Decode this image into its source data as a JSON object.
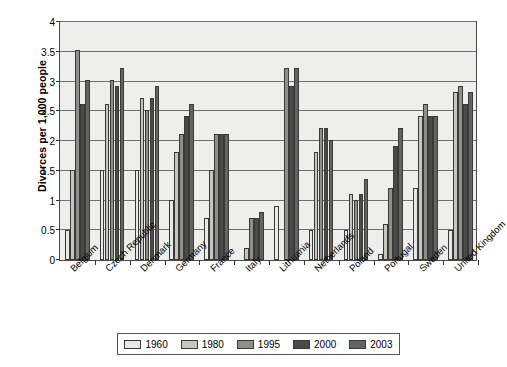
{
  "chart_data": {
    "type": "bar",
    "title": "",
    "xlabel": "",
    "ylabel": "Divorces per 1,000 people",
    "ylim": [
      0,
      4
    ],
    "ytick_step": 0.5,
    "yticks": [
      "0",
      "0.5",
      "1",
      "1.5",
      "2",
      "2.5",
      "3",
      "3.5",
      "4"
    ],
    "grid": true,
    "legend_position": "bottom",
    "categories": [
      "Belgium",
      "Czech Republic",
      "Denmark",
      "Germany",
      "France",
      "Italy",
      "Lithuania",
      "Netherlands",
      "Poland",
      "Portugal",
      "Sweden",
      "United Kingdom"
    ],
    "series": [
      {
        "name": "1960",
        "color": "#e8e8e4",
        "values": [
          0.5,
          1.5,
          1.5,
          1.0,
          0.7,
          0.0,
          0.9,
          0.5,
          0.5,
          0.1,
          1.2,
          0.5
        ]
      },
      {
        "name": "1980",
        "color": "#c6c6c0",
        "values": [
          1.5,
          2.6,
          2.7,
          1.8,
          1.5,
          0.2,
          0.0,
          1.8,
          1.1,
          0.6,
          2.4,
          2.8
        ]
      },
      {
        "name": "1995",
        "color": "#8f8f8a",
        "values": [
          3.5,
          3.0,
          2.5,
          2.1,
          2.1,
          0.7,
          3.2,
          2.2,
          1.0,
          1.2,
          2.6,
          2.9
        ]
      },
      {
        "name": "2000",
        "color": "#4a4a48",
        "values": [
          2.6,
          2.9,
          2.7,
          2.4,
          2.1,
          0.7,
          2.9,
          2.2,
          1.1,
          1.9,
          2.4,
          2.6
        ]
      },
      {
        "name": "2003",
        "color": "#636360",
        "values": [
          3.0,
          3.2,
          2.9,
          2.6,
          2.1,
          0.8,
          3.2,
          2.0,
          1.35,
          2.2,
          2.4,
          2.8
        ]
      }
    ]
  }
}
